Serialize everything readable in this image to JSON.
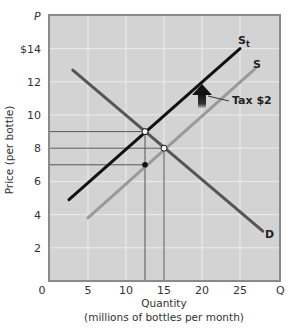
{
  "chart_data": {
    "type": "line",
    "title": "",
    "xlabel": "Quantity",
    "xlabel_sub": "(millions of bottles per month)",
    "ylabel": "Price (per bottle)",
    "x_axis_symbol": "Q",
    "y_axis_symbol": "P",
    "xlim": [
      0,
      30
    ],
    "ylim": [
      0,
      16
    ],
    "x_ticks": [
      "0",
      "5",
      "10",
      "15",
      "20",
      "25"
    ],
    "x_tick_values": [
      0,
      5,
      10,
      15,
      20,
      25
    ],
    "y_ticks": [
      "2",
      "4",
      "6",
      "8",
      "10",
      "12",
      "$14"
    ],
    "y_tick_values": [
      2,
      4,
      6,
      8,
      10,
      12,
      14
    ],
    "grid": true,
    "series": [
      {
        "name": "D",
        "label": "D",
        "color": "#555555",
        "points": [
          [
            3,
            12.7
          ],
          [
            28,
            3
          ]
        ]
      },
      {
        "name": "S",
        "label": "S",
        "color": "#9a9a9a",
        "points": [
          [
            5,
            3.8
          ],
          [
            27,
            12.8
          ]
        ]
      },
      {
        "name": "St",
        "label": "S",
        "subscript": "t",
        "color": "#111111",
        "points": [
          [
            2.5,
            4.9
          ],
          [
            25,
            14
          ]
        ]
      }
    ],
    "equilibria": [
      {
        "name": "after-tax equilibrium",
        "q": 12.5,
        "p": 9,
        "marker": "open-circle"
      },
      {
        "name": "pre-tax equilibrium",
        "q": 15,
        "p": 8,
        "marker": "open-circle"
      },
      {
        "name": "seller price after tax",
        "q": 12.5,
        "p": 7,
        "marker": "filled-circle"
      }
    ],
    "reference_lines": {
      "horizontal": [
        9,
        8,
        7
      ],
      "vertical": [
        12.5,
        15
      ]
    },
    "annotations": [
      {
        "text": "Tax $2",
        "type": "up-arrow",
        "q": 20,
        "p_from": 10.5,
        "p_to": 12
      }
    ]
  },
  "labels": {
    "y_symbol": "P",
    "x_symbol": "Q",
    "x_title": "Quantity",
    "x_subtitle": "(millions of bottles per month)",
    "y_title": "Price (per bottle)",
    "tax": "Tax $2",
    "d": "D",
    "s": "S",
    "st_main": "S",
    "st_sub": "t"
  }
}
